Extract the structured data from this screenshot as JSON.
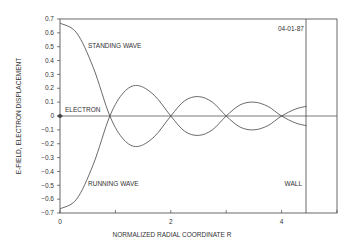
{
  "chart_data": {
    "type": "line",
    "title": "",
    "date_stamp": "04-01-87",
    "xlabel": "NORMALIZED RADIAL COORDINATE R",
    "ylabel": "E-FIELD, ELECTRON DISPLACEMENT",
    "xlim": [
      0,
      5
    ],
    "ylim": [
      -0.7,
      0.7
    ],
    "x_ticks": [
      "0",
      "2",
      "4"
    ],
    "y_ticks": [
      "0.7",
      "0.6",
      "0.5",
      "0.4",
      "0.3",
      "0.2",
      "0.1",
      "0",
      "-0.1",
      "-0.2",
      "-0.3",
      "-0.4",
      "-0.5",
      "-0.6",
      "-0.7"
    ],
    "grid": false,
    "annotations": [
      "STANDING WAVE",
      "RUNNING WAVE",
      "ELECTRON",
      "WALL"
    ],
    "wall_position": 4.45,
    "series": [
      {
        "name": "STANDING WAVE",
        "x": [
          0,
          0.3,
          0.6,
          0.9,
          1.15,
          1.4,
          1.7,
          2.0,
          2.25,
          2.5,
          2.75,
          3.0,
          3.25,
          3.5,
          3.75,
          4.0,
          4.25,
          4.45
        ],
        "y": [
          0.67,
          0.6,
          0.35,
          0.0,
          -0.17,
          -0.22,
          -0.15,
          0.0,
          0.11,
          0.14,
          0.1,
          0.0,
          -0.08,
          -0.1,
          -0.07,
          0.0,
          0.05,
          0.07
        ]
      },
      {
        "name": "RUNNING WAVE",
        "x": [
          0,
          0.3,
          0.6,
          0.9,
          1.15,
          1.4,
          1.7,
          2.0,
          2.25,
          2.5,
          2.75,
          3.0,
          3.25,
          3.5,
          3.75,
          4.0,
          4.25,
          4.45
        ],
        "y": [
          -0.67,
          -0.6,
          -0.35,
          0.0,
          0.17,
          0.22,
          0.15,
          0.0,
          -0.11,
          -0.14,
          -0.1,
          0.0,
          0.08,
          0.1,
          0.07,
          0.0,
          -0.05,
          -0.07
        ]
      }
    ]
  },
  "labels": {
    "date": "04-01-87",
    "standing": "STANDING WAVE",
    "running": "RUNNING WAVE",
    "electron": "ELECTRON",
    "wall": "WALL",
    "xlabel": "NORMALIZED RADIAL COORDINATE R",
    "ylabel": "E-FIELD, ELECTRON DISPLACEMENT"
  }
}
